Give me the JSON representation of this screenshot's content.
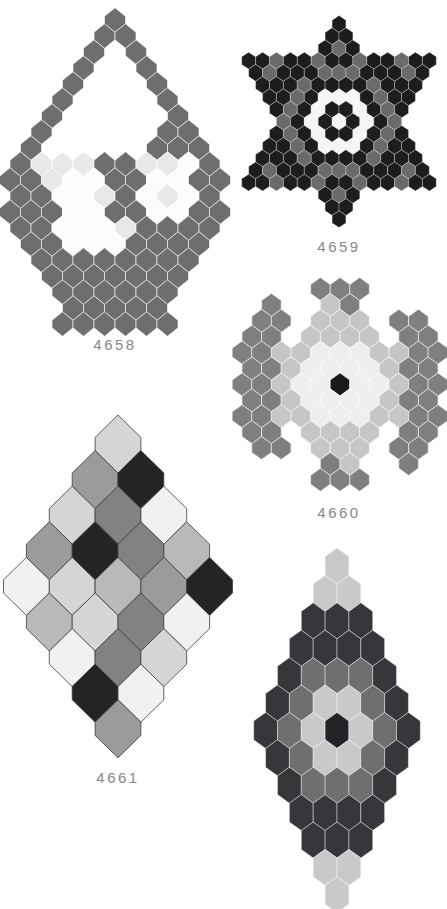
{
  "page": {
    "bg": "#ffffff",
    "width": 447,
    "height": 909
  },
  "label_style": {
    "color": "#878787",
    "size_px": 15
  },
  "figures": [
    {
      "id": "basket-4658",
      "label": "4658",
      "label_x": 115,
      "label_y": 350,
      "cx": 115,
      "top": 20,
      "pitch": 16,
      "hex_w": 21,
      "hex_h": 24.5,
      "stroke": "rgba(255,255,255,0.75)",
      "stroke_w": 0.8,
      "palette": {
        "D": "#6e6e6e",
        "L": "#e8e8e8",
        "W": "#fcfcfc"
      },
      "rows": [
        [
          [
            0,
            "D"
          ]
        ],
        [
          [
            -1,
            "D"
          ],
          [
            1,
            "D"
          ]
        ],
        [
          [
            -2,
            "D"
          ],
          [
            2,
            "D"
          ]
        ],
        [
          [
            -3,
            "D"
          ],
          [
            3,
            "D"
          ]
        ],
        [
          [
            -4,
            "D"
          ],
          [
            4,
            "D"
          ]
        ],
        [
          [
            -5,
            "D"
          ],
          [
            5,
            "D"
          ]
        ],
        [
          [
            -6,
            "D"
          ],
          [
            6,
            "D"
          ]
        ],
        [
          [
            -7,
            "D"
          ],
          [
            5,
            "D"
          ],
          [
            7,
            "D"
          ]
        ],
        [
          [
            -8,
            "D"
          ],
          [
            4,
            "D"
          ],
          [
            6,
            "D"
          ],
          [
            8,
            "D"
          ]
        ],
        [
          [
            -9,
            "D"
          ],
          [
            -7,
            "L"
          ],
          [
            -5,
            "L"
          ],
          [
            -3,
            "L"
          ],
          [
            -1,
            "D"
          ],
          [
            1,
            "D"
          ],
          [
            3,
            "L"
          ],
          [
            5,
            "L"
          ],
          [
            7,
            "W"
          ],
          [
            9,
            "D"
          ]
        ],
        [
          [
            -10,
            "D"
          ],
          [
            -8,
            "D"
          ],
          [
            -6,
            "L"
          ],
          [
            -4,
            "W"
          ],
          [
            -2,
            "W"
          ],
          [
            0,
            "D"
          ],
          [
            2,
            "D"
          ],
          [
            4,
            "W"
          ],
          [
            6,
            "W"
          ],
          [
            8,
            "D"
          ],
          [
            10,
            "D"
          ]
        ],
        [
          [
            -9,
            "D"
          ],
          [
            -7,
            "D"
          ],
          [
            -5,
            "W"
          ],
          [
            -3,
            "W"
          ],
          [
            -1,
            "L"
          ],
          [
            1,
            "D"
          ],
          [
            3,
            "W"
          ],
          [
            5,
            "L"
          ],
          [
            7,
            "W"
          ],
          [
            9,
            "D"
          ]
        ],
        [
          [
            -10,
            "D"
          ],
          [
            -8,
            "D"
          ],
          [
            -6,
            "D"
          ],
          [
            -4,
            "W"
          ],
          [
            -2,
            "W"
          ],
          [
            0,
            "D"
          ],
          [
            2,
            "D"
          ],
          [
            4,
            "W"
          ],
          [
            6,
            "W"
          ],
          [
            8,
            "D"
          ],
          [
            10,
            "D"
          ]
        ],
        [
          [
            -9,
            "D"
          ],
          [
            -7,
            "D"
          ],
          [
            -5,
            "W"
          ],
          [
            -3,
            "W"
          ],
          [
            -1,
            "W"
          ],
          [
            1,
            "L"
          ],
          [
            3,
            "D"
          ],
          [
            5,
            "D"
          ],
          [
            7,
            "D"
          ],
          [
            9,
            "D"
          ]
        ],
        [
          [
            -8,
            "D"
          ],
          [
            -6,
            "D"
          ],
          [
            -4,
            "W"
          ],
          [
            -2,
            "W"
          ],
          [
            0,
            "W"
          ],
          [
            2,
            "D"
          ],
          [
            4,
            "D"
          ],
          [
            6,
            "D"
          ],
          [
            8,
            "D"
          ]
        ],
        [
          [
            -7,
            "D"
          ],
          [
            -5,
            "D"
          ],
          [
            -3,
            "D"
          ],
          [
            -1,
            "D"
          ],
          [
            1,
            "D"
          ],
          [
            3,
            "D"
          ],
          [
            5,
            "D"
          ],
          [
            7,
            "D"
          ]
        ],
        [
          [
            -6,
            "D"
          ],
          [
            -4,
            "D"
          ],
          [
            -2,
            "D"
          ],
          [
            0,
            "D"
          ],
          [
            2,
            "D"
          ],
          [
            4,
            "D"
          ],
          [
            6,
            "D"
          ]
        ],
        [
          [
            -5,
            "D"
          ],
          [
            -3,
            "D"
          ],
          [
            -1,
            "D"
          ],
          [
            1,
            "D"
          ],
          [
            3,
            "D"
          ],
          [
            5,
            "D"
          ]
        ],
        [
          [
            -4,
            "D"
          ],
          [
            -2,
            "D"
          ],
          [
            0,
            "D"
          ],
          [
            2,
            "D"
          ],
          [
            4,
            "D"
          ]
        ],
        [
          [
            -5,
            "D"
          ],
          [
            -3,
            "D"
          ],
          [
            -1,
            "D"
          ],
          [
            1,
            "D"
          ],
          [
            3,
            "D"
          ],
          [
            5,
            "D"
          ]
        ]
      ]
    },
    {
      "id": "star-4659",
      "label": "4659",
      "label_x": 339,
      "label_y": 252,
      "cx": 339,
      "top": 24,
      "pitch": 12.2,
      "hex_w": 13.9,
      "hex_h": 16.8,
      "stroke": "rgba(255,255,255,0.5)",
      "stroke_w": 0.6,
      "palette": {
        "B": "#1d1d1d",
        "G": "#6a6a6a",
        "W": "#f5f5f5"
      },
      "rows": [
        "B",
        "BB",
        "BGB",
        "BBGBBGBBGBBGBB",
        "BGBBBGGGBBBGB",
        "BBBGBBBBGBBB",
        "BBGBWWWBGBB",
        "BGBWBBWBGB",
        "GBWBWBWBG",
        "BGBWBBWBGB",
        "BBGBWWWBGBB",
        "BBBGBBBBGBBB",
        "BGBBBGGGBBBGB",
        "BBGBBGBBGBBGBB",
        "BGB",
        "BB",
        "B"
      ]
    },
    {
      "id": "snowflake-4660",
      "label": "4660",
      "label_x": 339,
      "label_y": 518,
      "cx": 340,
      "top": 289,
      "pitch": 15.9,
      "hex_w": 19.6,
      "hex_h": 23,
      "stroke": "rgba(255,255,255,0.7)",
      "stroke_w": 0.8,
      "palette": {
        "D": "#7f7f7f",
        "M": "#c6c6c6",
        "W": "#eeeeee",
        "B": "#1a1a1a"
      },
      "rows": [
        [
          [
            -2,
            "D"
          ],
          [
            0,
            "D"
          ],
          [
            2,
            "D"
          ]
        ],
        [
          [
            -7,
            "D"
          ],
          [
            -1,
            "M"
          ],
          [
            1,
            "D"
          ]
        ],
        [
          [
            -8,
            "D"
          ],
          [
            -6,
            "D"
          ],
          [
            -2,
            "M"
          ],
          [
            0,
            "M"
          ],
          [
            2,
            "M"
          ],
          [
            6,
            "D"
          ],
          [
            8,
            "D"
          ]
        ],
        [
          [
            -9,
            "D"
          ],
          [
            -7,
            "D"
          ],
          [
            -3,
            "M"
          ],
          [
            -1,
            "M"
          ],
          [
            1,
            "M"
          ],
          [
            3,
            "M"
          ],
          [
            7,
            "D"
          ],
          [
            9,
            "D"
          ]
        ],
        [
          [
            -10,
            "D"
          ],
          [
            -8,
            "D"
          ],
          [
            -6,
            "M"
          ],
          [
            -4,
            "M"
          ],
          [
            -2,
            "W"
          ],
          [
            0,
            "W"
          ],
          [
            2,
            "W"
          ],
          [
            4,
            "M"
          ],
          [
            6,
            "M"
          ],
          [
            8,
            "D"
          ],
          [
            10,
            "D"
          ]
        ],
        [
          [
            -9,
            "D"
          ],
          [
            -7,
            "D"
          ],
          [
            -5,
            "M"
          ],
          [
            -3,
            "W"
          ],
          [
            -1,
            "W"
          ],
          [
            1,
            "W"
          ],
          [
            3,
            "W"
          ],
          [
            5,
            "M"
          ],
          [
            7,
            "D"
          ],
          [
            9,
            "D"
          ]
        ],
        [
          [
            -10,
            "D"
          ],
          [
            -8,
            "D"
          ],
          [
            -6,
            "M"
          ],
          [
            -4,
            "W"
          ],
          [
            -2,
            "W"
          ],
          [
            0,
            "B"
          ],
          [
            2,
            "W"
          ],
          [
            4,
            "W"
          ],
          [
            6,
            "M"
          ],
          [
            8,
            "D"
          ],
          [
            10,
            "D"
          ]
        ],
        [
          [
            -9,
            "D"
          ],
          [
            -7,
            "D"
          ],
          [
            -5,
            "M"
          ],
          [
            -3,
            "W"
          ],
          [
            -1,
            "W"
          ],
          [
            1,
            "W"
          ],
          [
            3,
            "W"
          ],
          [
            5,
            "M"
          ],
          [
            7,
            "D"
          ],
          [
            9,
            "D"
          ]
        ],
        [
          [
            -10,
            "D"
          ],
          [
            -8,
            "D"
          ],
          [
            -6,
            "M"
          ],
          [
            -4,
            "M"
          ],
          [
            -2,
            "W"
          ],
          [
            0,
            "W"
          ],
          [
            2,
            "W"
          ],
          [
            4,
            "M"
          ],
          [
            6,
            "M"
          ],
          [
            8,
            "D"
          ],
          [
            10,
            "D"
          ]
        ],
        [
          [
            -9,
            "D"
          ],
          [
            -7,
            "D"
          ],
          [
            -3,
            "M"
          ],
          [
            -1,
            "M"
          ],
          [
            1,
            "M"
          ],
          [
            3,
            "M"
          ],
          [
            7,
            "D"
          ],
          [
            9,
            "D"
          ]
        ],
        [
          [
            -8,
            "D"
          ],
          [
            -6,
            "D"
          ],
          [
            -2,
            "M"
          ],
          [
            0,
            "M"
          ],
          [
            2,
            "M"
          ],
          [
            6,
            "D"
          ],
          [
            8,
            "D"
          ]
        ],
        [
          [
            -1,
            "D"
          ],
          [
            1,
            "M"
          ],
          [
            7,
            "D"
          ]
        ],
        [
          [
            -2,
            "D"
          ],
          [
            0,
            "D"
          ],
          [
            2,
            "D"
          ]
        ]
      ]
    },
    {
      "id": "diamond-4661",
      "label": "4661",
      "label_x": 118,
      "label_y": 783,
      "cx": 118,
      "top": 444,
      "pitch": 35.6,
      "hex_w": 45.8,
      "hex_h": 58,
      "stroke": "#3c3c3c",
      "stroke_w": 0.8,
      "palette": {
        "V": "#f1f1f1",
        "L": "#d5d5d5",
        "E": "#b9b9b9",
        "M": "#9b9b9b",
        "D": "#828282",
        "B": "#242424"
      },
      "rows": [
        "L",
        "MB",
        "LDV",
        "MBDE",
        "VLEMB",
        "ELDV",
        "VDL",
        "BV",
        "M"
      ]
    },
    {
      "id": "diamond-bottom",
      "label": "",
      "label_x": 337,
      "label_y": 906,
      "cx": 337,
      "top": 566,
      "pitch": 27.4,
      "hex_w": 23.8,
      "hex_h": 36,
      "stroke": "rgba(255,255,255,0.6)",
      "stroke_w": 0.7,
      "palette": {
        "L": "#c9c9c9",
        "D": "#36363b",
        "G": "#6f6f6f",
        "B": "#232328"
      },
      "rows": [
        "L",
        "LL",
        "DDD",
        "DDDD",
        "DGGGD",
        "DGLLGD",
        "DGLBLGD",
        "DGLLGD",
        "DGGGD",
        "DDDD",
        "DDD",
        "LL",
        "L"
      ]
    }
  ]
}
